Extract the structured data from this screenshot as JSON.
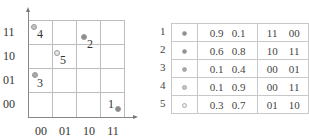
{
  "plot": {
    "y_labels": [
      "11",
      "10",
      "01",
      "00"
    ],
    "x_labels": [
      "00",
      "01",
      "10",
      "11"
    ],
    "points": [
      {
        "id": "1",
        "x": 118,
        "y": 109,
        "lx": 110,
        "ly": 98,
        "fill": "#8a8a8a"
      },
      {
        "id": "2",
        "x": 84,
        "y": 37,
        "lx": 88,
        "ly": 39,
        "fill": "#8f8f8f"
      },
      {
        "id": "3",
        "x": 35,
        "y": 75,
        "lx": 38,
        "ly": 78,
        "fill": "#a8a8a8"
      },
      {
        "id": "4",
        "x": 34,
        "y": 27,
        "lx": 38,
        "ly": 29,
        "fill": "#c4c4c4"
      },
      {
        "id": "5",
        "x": 57,
        "y": 53,
        "lx": 60,
        "ly": 55,
        "fill": "#e6e6e6"
      }
    ]
  },
  "table": {
    "rows": [
      {
        "num": "1",
        "dot": "#8a8a8a",
        "a": "0.9",
        "b": "0.1",
        "c": "11",
        "d": "00"
      },
      {
        "num": "2",
        "dot": "#8f8f8f",
        "a": "0.6",
        "b": "0.8",
        "c": "10",
        "d": "11"
      },
      {
        "num": "3",
        "dot": "#a8a8a8",
        "a": "0.1",
        "b": "0.4",
        "c": "00",
        "d": "01"
      },
      {
        "num": "4",
        "dot": "#c4c4c4",
        "a": "0.1",
        "b": "0.9",
        "c": "00",
        "d": "11"
      },
      {
        "num": "5",
        "dot": "#f0f0f0",
        "a": "0.3",
        "b": "0.7",
        "c": "01",
        "d": "10"
      }
    ]
  }
}
